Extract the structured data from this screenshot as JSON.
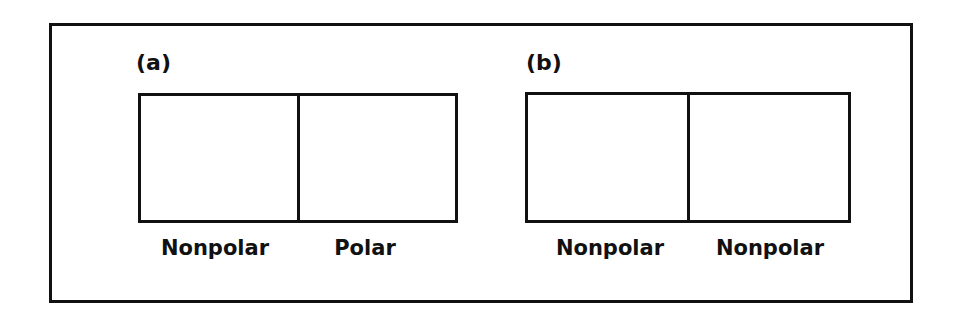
{
  "figure": {
    "panels": [
      {
        "label": "(a)",
        "regions": [
          "Nonpolar",
          "Polar"
        ]
      },
      {
        "label": "(b)",
        "regions": [
          "Nonpolar",
          "Nonpolar"
        ]
      }
    ]
  }
}
